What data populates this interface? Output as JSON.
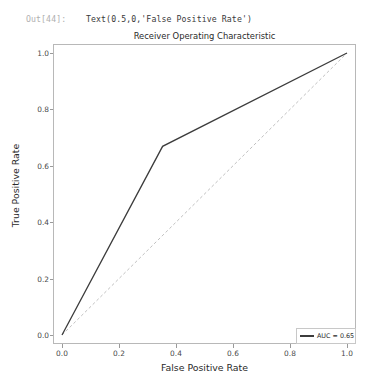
{
  "notebook": {
    "out_prompt": "Out[44]:",
    "out_value": "Text(0.5,0,'False Positive Rate')"
  },
  "legend": {
    "swatch_name": "roc-line-swatch",
    "label": "AUC = 0.65"
  },
  "chart_data": {
    "type": "line",
    "title": "Receiver Operating Characteristic",
    "xlabel": "False Positive Rate",
    "ylabel": "True Positive Rate",
    "xlim": [
      0.0,
      1.0
    ],
    "ylim": [
      0.0,
      1.0
    ],
    "grid": false,
    "legend_position": "lower right",
    "xticks": [
      "0.0",
      "0.2",
      "0.4",
      "0.6",
      "0.8",
      "1.0"
    ],
    "xtick_values": [
      0.0,
      0.2,
      0.4,
      0.6,
      0.8,
      1.0
    ],
    "yticks": [
      "0.0",
      "0.2",
      "0.4",
      "0.6",
      "0.8",
      "1.0"
    ],
    "ytick_values": [
      0.0,
      0.2,
      0.4,
      0.6,
      0.8,
      1.0
    ],
    "series": [
      {
        "name": "AUC = 0.65",
        "style": "solid",
        "color": "#3c3c3c",
        "x": [
          0.0,
          0.353,
          1.0
        ],
        "y": [
          0.0,
          0.669,
          1.0
        ]
      },
      {
        "name": "chance-diagonal",
        "style": "dashed",
        "color": "#b9b9b9",
        "x": [
          0.0,
          1.0
        ],
        "y": [
          0.0,
          1.0
        ]
      }
    ],
    "annotations": {
      "auc_value": 0.65
    }
  }
}
